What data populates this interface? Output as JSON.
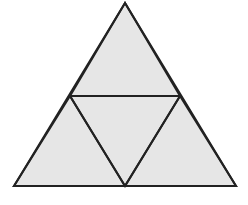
{
  "diagram": {
    "fill_color": "#e6e6e6",
    "stroke_color": "#222222",
    "vertices": {
      "apex": [
        125,
        3
      ],
      "bottom_left": [
        14,
        186
      ],
      "bottom_right": [
        236,
        186
      ],
      "mid_left": [
        70,
        96
      ],
      "mid_right": [
        180,
        96
      ],
      "mid_bottom": [
        125,
        186
      ]
    },
    "sub_triangles": [
      {
        "name": "top",
        "points": "125,3 70,96 180,96"
      },
      {
        "name": "bottom-left",
        "points": "70,96 14,186 125,186"
      },
      {
        "name": "center",
        "points": "70,96 180,96 125,186"
      },
      {
        "name": "bottom-right",
        "points": "180,96 125,186 236,186"
      }
    ]
  }
}
